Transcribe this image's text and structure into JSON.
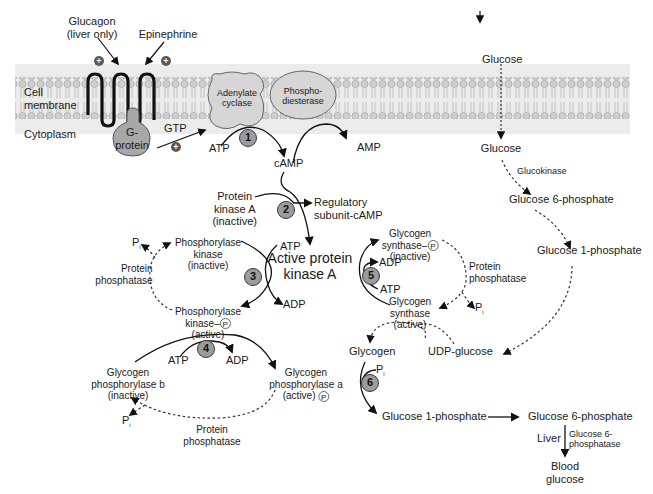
{
  "membrane": {
    "label_cell_membrane": "Cell\nmembrane",
    "label_cell": "Cell",
    "label_membrane": "membrane",
    "label_cytoplasm": "Cytoplasm",
    "color_band": "#e6e6e6",
    "color_lipid": "#b8b8b8"
  },
  "receptor": {
    "glucagon_line1": "Glucagon",
    "glucagon_line2": "(liver only)",
    "epinephrine": "Epinephrine",
    "plus_symbol": "+"
  },
  "gprotein": {
    "line1": "G-",
    "line2": "protein",
    "gtp": "GTP"
  },
  "adenylate_cyclase": {
    "line1": "Adenylate",
    "line2": "cyclase"
  },
  "phosphodiesterase": {
    "line1": "Phospho-",
    "line2": "diesterase"
  },
  "metabolites": {
    "atp": "ATP",
    "adp": "ADP",
    "camp": "cAMP",
    "amp": "AMP",
    "pi": "P",
    "pi_sub": "i",
    "p_circle": "P"
  },
  "pka": {
    "inactive_line1": "Protein",
    "inactive_line2": "kinase A",
    "inactive_line3": "(inactive)",
    "regulatory_line1": "Regulatory",
    "regulatory_line2": "subunit-cAMP",
    "active_line1": "Active protein",
    "active_line2": "kinase A"
  },
  "phosphorylase_kinase": {
    "inactive_line1": "Phosphorylase",
    "inactive_line2": "kinase",
    "inactive_line3": "(inactive)",
    "active_line1": "Phosphorylase",
    "active_line2": "kinase–",
    "active_line3": "(active)"
  },
  "glycogen_phosphorylase": {
    "b_line1": "Glycogen",
    "b_line2": "phosphorylase b",
    "b_line3": "(inactive)",
    "a_line1": "Glycogen",
    "a_line2": "phosphorylase a",
    "a_line3": "(active)"
  },
  "glycogen_synthase": {
    "inactive_line1": "Glycogen",
    "inactive_line2": "synthase–",
    "inactive_line3": "(inactive)",
    "active_line1": "Glycogen",
    "active_line2": "synthase",
    "active_line3": "(active)"
  },
  "protein_phosphatase": {
    "line1": "Protein",
    "line2": "phosphatase"
  },
  "glucose_path": {
    "glucose_outside": "Glucose",
    "glucose_inside": "Glucose",
    "glucokinase": "Glucokinase",
    "g6p_top": "Glucose 6-phosphate",
    "g1p_top": "Glucose 1-phosphate",
    "udp_glucose": "UDP-glucose",
    "glycogen": "Glycogen",
    "g1p_bottom": "Glucose 1-phosphate",
    "g6p_bottom": "Glucose 6-phosphate",
    "liver": "Liver",
    "g6pase_line1": "Glucose 6-",
    "g6pase_line2": "phosphatase",
    "blood_line1": "Blood",
    "blood_line2": "glucose"
  },
  "steps": [
    "1",
    "2",
    "3",
    "4",
    "5",
    "6"
  ],
  "colors": {
    "step_fill": "#9c9c9c",
    "protein_fill": "#d4d4d4",
    "gprotein_fill": "#a8a8a8",
    "line": "#111111"
  }
}
